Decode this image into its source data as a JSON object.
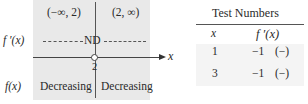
{
  "sign_chart": {
    "intervals": [
      "(−∞, 2)",
      "(2, ∞)"
    ],
    "derivative_label": "f ′(x)",
    "derivative_value": "ND",
    "critical_point": "2",
    "axis_label": "x",
    "function_label": "f(x)",
    "behavior": [
      "Decreasing",
      "Decreasing"
    ],
    "colors": {
      "background": "#e9e9e9",
      "lines": "#555555"
    }
  },
  "test_table": {
    "title": "Test Numbers",
    "headers": [
      "x",
      "f ′(x)"
    ],
    "rows": [
      {
        "x": "1",
        "fprime": "−1",
        "sign": "(−)"
      },
      {
        "x": "3",
        "fprime": "−1",
        "sign": "(−)"
      }
    ]
  }
}
